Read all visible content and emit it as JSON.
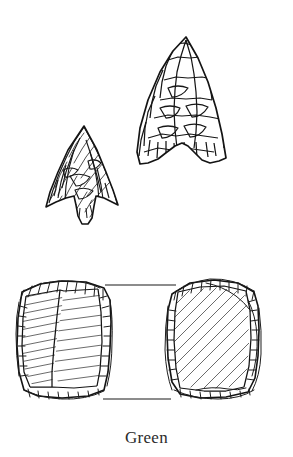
{
  "figure": {
    "kind": "archaeological-line-drawing",
    "caption": "Green",
    "background_color": "#ffffff",
    "ink_color": "#1a1a1a",
    "hatch_color": "#3a3a3a",
    "artifacts": [
      {
        "id": "small-projectile-point",
        "label": "small side-notched projectile point",
        "view": "face",
        "position": "upper-left",
        "bbox": [
          42,
          125,
          80,
          100
        ],
        "shading": "dense-hatched-flake-scars"
      },
      {
        "id": "large-projectile-point",
        "label": "large concave-base projectile point",
        "view": "face",
        "position": "upper-right",
        "bbox": [
          135,
          36,
          93,
          129
        ],
        "shading": "outlined-flake-scars"
      },
      {
        "id": "left-scraper",
        "label": "rectangular end scraper, left",
        "view": "dorsal",
        "position": "lower-left",
        "bbox": [
          17,
          277,
          95,
          123
        ],
        "shading": "parallel-hatch-two-facets"
      },
      {
        "id": "right-scraper",
        "label": "rectangular end scraper, right",
        "view": "ventral",
        "position": "lower-right",
        "bbox": [
          163,
          277,
          95,
          123
        ],
        "shading": "diagonal-hatch-single-facet"
      }
    ],
    "scale_marks": [
      {
        "id": "upper-scale-rule",
        "x1": 105,
        "x2": 176,
        "y": 285
      },
      {
        "id": "lower-scale-rule",
        "x1": 103,
        "x2": 171,
        "y": 399
      }
    ]
  }
}
